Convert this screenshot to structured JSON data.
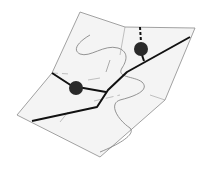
{
  "diagram": {
    "type": "folded-map-illustration",
    "colors": {
      "background": "#ffffff",
      "map_fill": "#f4f4f4",
      "outline": "#8a8a8a",
      "contour": "#7a7a7a",
      "road": "#111111",
      "marker": "#2a2a2a"
    },
    "markers": [
      {
        "name": "marker-1",
        "cx": 76,
        "cy": 88,
        "r": 7
      },
      {
        "name": "marker-2",
        "cx": 141,
        "cy": 49,
        "r": 7
      }
    ]
  }
}
